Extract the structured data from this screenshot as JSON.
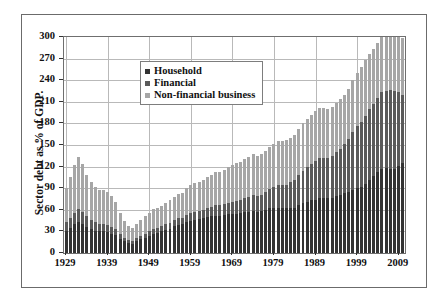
{
  "chart_data": {
    "type": "bar",
    "stacked": true,
    "title": "",
    "xlabel": "",
    "ylabel": "Sector debt as % of GDP.",
    "ylim": [
      0,
      300
    ],
    "ytick_labels": [
      "300",
      "270",
      "240",
      "210",
      "180",
      "150",
      "120",
      "90",
      "60",
      "30",
      "0"
    ],
    "ytick_values": [
      300,
      270,
      240,
      210,
      180,
      150,
      120,
      90,
      60,
      30,
      0
    ],
    "xtick_labels": [
      "1929",
      "1939",
      "1949",
      "1959",
      "1969",
      "1979",
      "1989",
      "1999",
      "2009"
    ],
    "xtick_values": [
      1929,
      1939,
      1949,
      1959,
      1969,
      1979,
      1989,
      1999,
      2009
    ],
    "grid": true,
    "legend_position": "upper-center",
    "legend": [
      "Household",
      "Financial",
      "Non-financial business"
    ],
    "colors": {
      "household": "#333333",
      "financial": "#5a5a5a",
      "nonfinancial_business": "#a6a6a6",
      "gridline": "#b9b9b9",
      "axis": "#6f6f6f",
      "frame": "#6b6b6b",
      "text": "#111111",
      "background": "#ffffff"
    },
    "x": [
      1929,
      1930,
      1931,
      1932,
      1933,
      1934,
      1935,
      1936,
      1937,
      1938,
      1939,
      1940,
      1941,
      1942,
      1943,
      1944,
      1945,
      1946,
      1947,
      1948,
      1949,
      1950,
      1951,
      1952,
      1953,
      1954,
      1955,
      1956,
      1957,
      1958,
      1959,
      1960,
      1961,
      1962,
      1963,
      1964,
      1965,
      1966,
      1967,
      1968,
      1969,
      1970,
      1971,
      1972,
      1973,
      1974,
      1975,
      1976,
      1977,
      1978,
      1979,
      1980,
      1981,
      1982,
      1983,
      1984,
      1985,
      1986,
      1987,
      1988,
      1989,
      1990,
      1991,
      1992,
      1993,
      1994,
      1995,
      1996,
      1997,
      1998,
      1999,
      2000,
      2001,
      2002,
      2003,
      2004,
      2005,
      2006,
      2007,
      2008,
      2009,
      2010
    ],
    "series": [
      {
        "name": "Household",
        "color": "#333333",
        "values": [
          31,
          35,
          40,
          43,
          40,
          36,
          33,
          31,
          30,
          30,
          29,
          27,
          25,
          20,
          16,
          14,
          13,
          16,
          19,
          21,
          24,
          27,
          28,
          30,
          32,
          34,
          37,
          39,
          40,
          43,
          45,
          46,
          47,
          48,
          50,
          51,
          52,
          52,
          53,
          54,
          54,
          54,
          55,
          57,
          57,
          58,
          57,
          58,
          60,
          62,
          63,
          63,
          62,
          62,
          63,
          63,
          66,
          69,
          71,
          73,
          74,
          76,
          76,
          76,
          77,
          79,
          81,
          83,
          85,
          88,
          90,
          92,
          96,
          102,
          107,
          112,
          119,
          126,
          131,
          133,
          130,
          125
        ]
      },
      {
        "name": "Financial",
        "color": "#5a5a5a",
        "values": [
          12,
          14,
          16,
          18,
          17,
          15,
          13,
          12,
          11,
          11,
          10,
          9,
          8,
          6,
          5,
          4,
          4,
          5,
          5,
          6,
          6,
          7,
          7,
          7,
          8,
          8,
          9,
          9,
          9,
          10,
          10,
          11,
          11,
          12,
          13,
          13,
          14,
          14,
          15,
          16,
          17,
          18,
          19,
          20,
          21,
          22,
          22,
          23,
          25,
          27,
          29,
          31,
          32,
          33,
          35,
          38,
          42,
          45,
          48,
          51,
          54,
          56,
          56,
          56,
          58,
          61,
          64,
          68,
          73,
          80,
          86,
          90,
          95,
          98,
          100,
          104,
          110,
          116,
          122,
          124,
          112,
          95
        ]
      },
      {
        "name": "Non-financial business",
        "color": "#a6a6a6",
        "values": [
          48,
          56,
          66,
          72,
          66,
          58,
          52,
          49,
          47,
          47,
          46,
          43,
          38,
          30,
          24,
          20,
          18,
          20,
          22,
          24,
          25,
          27,
          28,
          29,
          30,
          31,
          32,
          34,
          35,
          38,
          39,
          40,
          41,
          42,
          43,
          44,
          46,
          47,
          48,
          49,
          51,
          53,
          53,
          54,
          55,
          58,
          56,
          56,
          57,
          58,
          60,
          61,
          61,
          62,
          62,
          63,
          64,
          66,
          67,
          68,
          69,
          70,
          69,
          68,
          68,
          68,
          69,
          69,
          70,
          72,
          74,
          76,
          77,
          76,
          76,
          76,
          78,
          80,
          83,
          86,
          82,
          78
        ]
      }
    ]
  }
}
